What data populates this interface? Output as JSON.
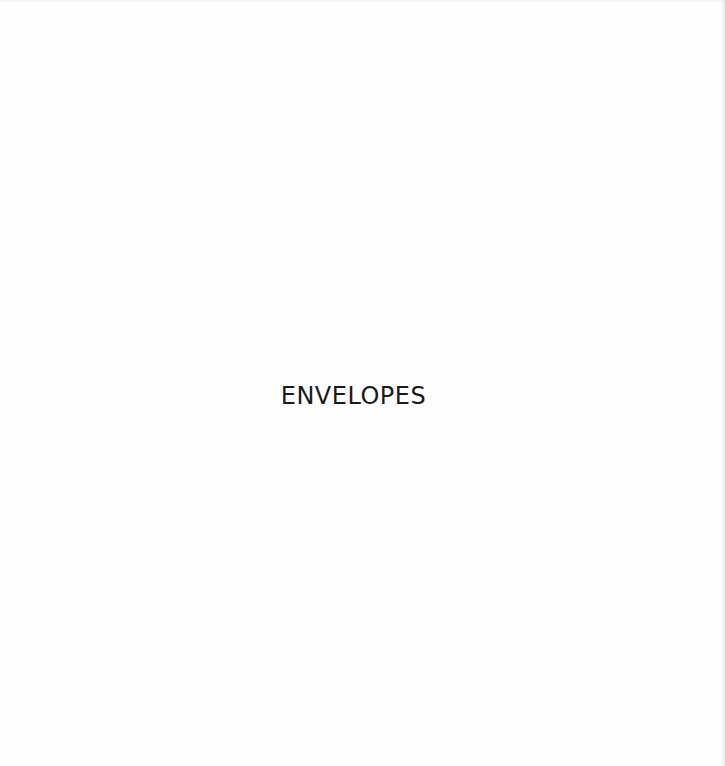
{
  "page": {
    "title": "ENVELOPES",
    "background_color": "#fefefe",
    "text_color": "#1a1a1a"
  }
}
